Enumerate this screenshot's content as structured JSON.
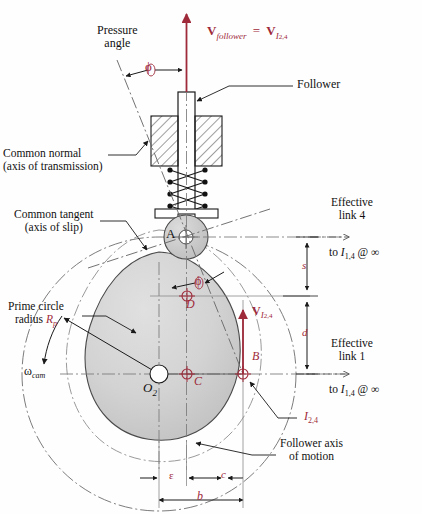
{
  "figure": {
    "type": "engineering-diagram",
    "colors": {
      "accent_red": "#9e2a3a",
      "line_black": "#1a1a1a",
      "cam_fill": "#d2d2d2",
      "roller_fill": "#c9c9c9",
      "background": "#fefefe"
    }
  },
  "labels": {
    "pressure_angle_line1": "Pressure",
    "pressure_angle_line2": "angle",
    "phi_symbol": "ϕ",
    "phi_symbol_cam": "ϕ",
    "velocity_follower_V": "V",
    "velocity_follower_sub": "follower",
    "velocity_equals": "=",
    "velocity_I_V": "V",
    "velocity_I_sub_I": "I",
    "velocity_I_sub_nums": "2,4",
    "follower": "Follower",
    "common_normal_line1": "Common normal",
    "common_normal_line2": "(axis of transmission)",
    "common_tangent_line1": "Common tangent",
    "common_tangent_line2": "(axis of slip)",
    "prime_circle_line1": "Prime circle",
    "prime_circle_line2_pre": "radius",
    "prime_circle_R": "R",
    "prime_circle_sub": "p",
    "omega_cam": "ω",
    "omega_cam_sub": "cam",
    "effective_link4_line1": "Effective",
    "effective_link4_line2": "link  4",
    "effective_link1_line1": "Effective",
    "effective_link1_line2": "link  1",
    "to_I14_inf_top_pre": "to",
    "to_I14_inf_top_I": "I",
    "to_I14_inf_top_sub": "1,4",
    "to_I14_inf_top_post": "@  ∞",
    "to_I14_inf_bot_pre": "to",
    "to_I14_inf_bot_I": "I",
    "to_I14_inf_bot_sub": "1,4",
    "to_I14_inf_bot_post": "@  ∞",
    "point_A": "A",
    "point_B": "B",
    "point_C": "C",
    "point_D": "D",
    "point_O2_main": "O",
    "point_O2_sub": "2",
    "instant_center_I": "I",
    "instant_center_sub": "2,4",
    "dim_s": "s",
    "dim_d": "d",
    "dim_epsilon": "ε",
    "dim_c": "c",
    "dim_b": "b",
    "follower_axis_line1": "Follower axis",
    "follower_axis_line2": "of motion"
  },
  "geometry": {
    "cam_center_O2": {
      "x": 159,
      "y": 374
    },
    "point_C": {
      "x": 187,
      "y": 374
    },
    "point_D": {
      "x": 187,
      "y": 296
    },
    "point_B": {
      "x": 243,
      "y": 374
    },
    "point_A_roller": {
      "x": 186,
      "y": 237
    },
    "roller_radius": 22,
    "offset_epsilon": 28,
    "distance_c": 56,
    "distance_b": 84,
    "dimension_s_top": 243,
    "dimension_s_bottom": 296,
    "dimension_d_top": 296,
    "dimension_d_bottom": 374
  }
}
